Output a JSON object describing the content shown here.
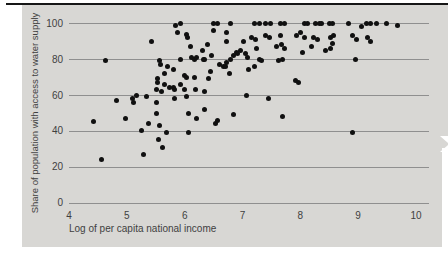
{
  "chart_data": {
    "type": "scatter",
    "title": "",
    "xlabel": "Log of per capita national income",
    "ylabel": "Share of population with access to water supply",
    "xlim": [
      4,
      10
    ],
    "ylim": [
      0,
      100
    ],
    "x_ticks": [
      "4",
      "5",
      "6",
      "7",
      "8",
      "9",
      "10"
    ],
    "y_ticks": [
      "0",
      "20",
      "40",
      "60",
      "80",
      "100"
    ],
    "grid": "horizontal-only",
    "legend": "none",
    "marker": {
      "shape": "circle",
      "color": "#101010",
      "diameter_px": 5
    },
    "points": [
      [
        4.43,
        45
      ],
      [
        4.56,
        24
      ],
      [
        4.63,
        79
      ],
      [
        4.83,
        57
      ],
      [
        4.97,
        47
      ],
      [
        5.1,
        58
      ],
      [
        5.11,
        56
      ],
      [
        5.16,
        60
      ],
      [
        5.26,
        40
      ],
      [
        5.28,
        27
      ],
      [
        5.34,
        59
      ],
      [
        5.37,
        44
      ],
      [
        5.42,
        90
      ],
      [
        5.51,
        63
      ],
      [
        5.52,
        50
      ],
      [
        5.52,
        56
      ],
      [
        5.53,
        67
      ],
      [
        5.53,
        69
      ],
      [
        5.55,
        35
      ],
      [
        5.56,
        43
      ],
      [
        5.56,
        79
      ],
      [
        5.59,
        77
      ],
      [
        5.6,
        62
      ],
      [
        5.62,
        31
      ],
      [
        5.65,
        66
      ],
      [
        5.66,
        72
      ],
      [
        5.69,
        39
      ],
      [
        5.71,
        76
      ],
      [
        5.73,
        64
      ],
      [
        5.8,
        64
      ],
      [
        5.8,
        74
      ],
      [
        5.83,
        58
      ],
      [
        5.83,
        63
      ],
      [
        5.85,
        99
      ],
      [
        5.88,
        95
      ],
      [
        5.92,
        66
      ],
      [
        5.92,
        80
      ],
      [
        5.92,
        100
      ],
      [
        5.99,
        63
      ],
      [
        5.99,
        71
      ],
      [
        6.04,
        59
      ],
      [
        6.04,
        70
      ],
      [
        6.04,
        94
      ],
      [
        6.05,
        92
      ],
      [
        6.06,
        39
      ],
      [
        6.06,
        50
      ],
      [
        6.1,
        87
      ],
      [
        6.11,
        81
      ],
      [
        6.17,
        70
      ],
      [
        6.17,
        80
      ],
      [
        6.18,
        63
      ],
      [
        6.21,
        47
      ],
      [
        6.21,
        81
      ],
      [
        6.31,
        85
      ],
      [
        6.32,
        80
      ],
      [
        6.34,
        80
      ],
      [
        6.35,
        52
      ],
      [
        6.35,
        62
      ],
      [
        6.39,
        88
      ],
      [
        6.42,
        69
      ],
      [
        6.44,
        73
      ],
      [
        6.47,
        82
      ],
      [
        6.5,
        96
      ],
      [
        6.5,
        100
      ],
      [
        6.53,
        44
      ],
      [
        6.56,
        46
      ],
      [
        6.57,
        100
      ],
      [
        6.61,
        77
      ],
      [
        6.67,
        76
      ],
      [
        6.7,
        76
      ],
      [
        6.72,
        90
      ],
      [
        6.73,
        78
      ],
      [
        6.73,
        95
      ],
      [
        6.77,
        72
      ],
      [
        6.79,
        80
      ],
      [
        6.79,
        100
      ],
      [
        6.84,
        82
      ],
      [
        6.85,
        49
      ],
      [
        6.89,
        84
      ],
      [
        6.91,
        83
      ],
      [
        6.96,
        85
      ],
      [
        7.01,
        90
      ],
      [
        7.05,
        83
      ],
      [
        7.07,
        60
      ],
      [
        7.09,
        81
      ],
      [
        7.11,
        74
      ],
      [
        7.15,
        92
      ],
      [
        7.21,
        76
      ],
      [
        7.21,
        100
      ],
      [
        7.23,
        91
      ],
      [
        7.25,
        86
      ],
      [
        7.3,
        80
      ],
      [
        7.3,
        100
      ],
      [
        7.33,
        79
      ],
      [
        7.39,
        93
      ],
      [
        7.4,
        100
      ],
      [
        7.45,
        58
      ],
      [
        7.46,
        92
      ],
      [
        7.48,
        100
      ],
      [
        7.59,
        87
      ],
      [
        7.62,
        79
      ],
      [
        7.65,
        93
      ],
      [
        7.65,
        100
      ],
      [
        7.68,
        88
      ],
      [
        7.69,
        48
      ],
      [
        7.69,
        80
      ],
      [
        7.72,
        86
      ],
      [
        7.72,
        100
      ],
      [
        7.91,
        68
      ],
      [
        7.94,
        93
      ],
      [
        7.96,
        67
      ],
      [
        8.01,
        95
      ],
      [
        8.04,
        84
      ],
      [
        8.07,
        92
      ],
      [
        8.08,
        100
      ],
      [
        8.13,
        100
      ],
      [
        8.19,
        87
      ],
      [
        8.23,
        92
      ],
      [
        8.26,
        100
      ],
      [
        8.29,
        91
      ],
      [
        8.33,
        100
      ],
      [
        8.37,
        100
      ],
      [
        8.43,
        85
      ],
      [
        8.5,
        100
      ],
      [
        8.52,
        92
      ],
      [
        8.53,
        86
      ],
      [
        8.55,
        100
      ],
      [
        8.56,
        89
      ],
      [
        8.57,
        93
      ],
      [
        8.83,
        100
      ],
      [
        8.91,
        39
      ],
      [
        8.91,
        93
      ],
      [
        8.95,
        80
      ],
      [
        8.97,
        91
      ],
      [
        9.06,
        98
      ],
      [
        9.14,
        100
      ],
      [
        9.16,
        92
      ],
      [
        9.21,
        90
      ],
      [
        9.21,
        100
      ],
      [
        9.32,
        100
      ],
      [
        9.49,
        100
      ],
      [
        9.68,
        99
      ]
    ]
  },
  "colors": {
    "page_bg": "#ffffff",
    "panel_bg": "#d8d7d4",
    "grid_line": "#8f8f8f",
    "tick_text": "#3f3f3f",
    "top_rule": "#161616",
    "dot": "#101010"
  }
}
